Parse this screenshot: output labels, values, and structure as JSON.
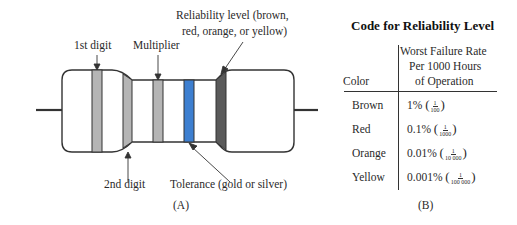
{
  "figure_a": {
    "caption": "(A)",
    "labels": {
      "first_digit": "1st digit",
      "second_digit": "2nd digit",
      "multiplier": "Multiplier",
      "tolerance": "Tolerance (gold or silver)",
      "reliability_line1": "Reliability level (brown,",
      "reliability_line2": "red, orange, or yellow)"
    },
    "band_colors": {
      "first_digit": "#b5b5b5",
      "second_digit": "#b5b5b5",
      "multiplier": "#b5b5b5",
      "tolerance": "#3d7fd0",
      "reliability": "#5a5a5a"
    }
  },
  "figure_b": {
    "caption": "(B)",
    "title": "Code for Reliability Level",
    "headers": {
      "color": "Color",
      "rate_line1": "Worst Failure Rate",
      "rate_line2": "Per 1000 Hours",
      "rate_line3": "of Operation"
    },
    "rows": [
      {
        "color": "Brown",
        "percent": "1%",
        "frac_num": "1",
        "frac_den": "100"
      },
      {
        "color": "Red",
        "percent": "0.1%",
        "frac_num": "1",
        "frac_den": "1000"
      },
      {
        "color": "Orange",
        "percent": "0.01%",
        "frac_num": "1",
        "frac_den": "10 000"
      },
      {
        "color": "Yellow",
        "percent": "0.001%",
        "frac_num": "1",
        "frac_den": "100 000"
      }
    ]
  }
}
